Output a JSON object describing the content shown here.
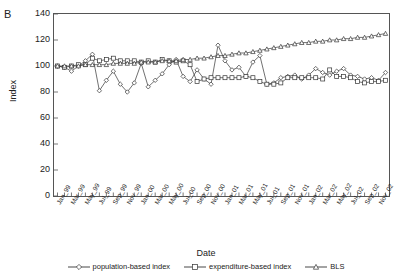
{
  "panel": {
    "label": "B"
  },
  "axes": {
    "ylabel": "Index",
    "xlabel": "Date",
    "yticks": [
      0,
      20,
      40,
      60,
      80,
      100,
      120,
      140
    ],
    "ylim": [
      0,
      140
    ],
    "grid": false
  },
  "legend": {
    "position": "bottom-center",
    "items": [
      {
        "label": "population-based index",
        "marker": "diamond-marker-icon"
      },
      {
        "label": "expenditure-based index",
        "marker": "square-marker-icon"
      },
      {
        "label": "BLS",
        "marker": "triangle-marker-icon"
      }
    ]
  },
  "chart_data": {
    "type": "line",
    "title": "B",
    "xlabel": "Date",
    "ylabel": "Index",
    "ylim": [
      0,
      140
    ],
    "yticks": [
      0,
      20,
      40,
      60,
      80,
      100,
      120,
      140
    ],
    "grid": false,
    "legend_position": "bottom-center",
    "x": [
      "Jan_99",
      "Feb_99",
      "Mar_99",
      "Apr_99",
      "May_99",
      "Jun_99",
      "Jul_99",
      "Aug_99",
      "Sep_99",
      "Oct_99",
      "Nov_99",
      "Dec_99",
      "Jan_00",
      "Feb_00",
      "Mar_00",
      "Apr_00",
      "May_00",
      "Jun_00",
      "Jul_00",
      "Aug_00",
      "Sep_00",
      "Oct_00",
      "Nov_00",
      "Dec_00",
      "Jan_01",
      "Feb_01",
      "Mar_01",
      "Apr_01",
      "May_01",
      "Jun_01",
      "Jul_01",
      "Aug_01",
      "Sep_01",
      "Oct_01",
      "Nov_01",
      "Dec_01",
      "Jan_02",
      "Feb_02",
      "Mar_02",
      "Apr_02",
      "May_02",
      "Jun_02",
      "Jul_02",
      "Aug_02",
      "Sep_02",
      "Oct_02",
      "Nov_02",
      "Dec_02"
    ],
    "xtick_labels": [
      "Jan_99",
      "Mar_99",
      "May_99",
      "Jul_99",
      "Sep_99",
      "Nov_99",
      "Jan_00",
      "Mar_00",
      "May_00",
      "Jul_00",
      "Sep_00",
      "Nov_00",
      "Jan_01",
      "Mar_01",
      "May_01",
      "Jul_01",
      "Sep_01",
      "Nov_01",
      "Jan_02",
      "Mar_02",
      "May_02",
      "Jul_02",
      "Sep_02",
      "Nov_02"
    ],
    "series": [
      {
        "name": "population-based index",
        "marker": "diamond",
        "values": [
          100,
          99,
          96,
          100,
          104,
          109,
          81,
          89,
          96,
          86,
          80,
          87,
          102,
          84,
          89,
          94,
          101,
          105,
          92,
          88,
          97,
          90,
          86,
          116,
          104,
          97,
          99,
          92,
          103,
          108,
          86,
          87,
          91,
          92,
          93,
          90,
          93,
          98,
          95,
          93,
          96,
          98,
          93,
          92,
          90,
          91,
          89,
          95
        ]
      },
      {
        "name": "expenditure-based index",
        "marker": "square",
        "values": [
          100,
          99,
          100,
          101,
          101,
          106,
          104,
          105,
          106,
          104,
          104,
          104,
          103,
          104,
          103,
          105,
          104,
          103,
          104,
          101,
          88,
          90,
          91,
          91,
          91,
          91,
          91,
          92,
          91,
          88,
          86,
          86,
          87,
          91,
          91,
          91,
          91,
          91,
          90,
          97,
          92,
          92,
          91,
          88,
          87,
          88,
          88,
          89
        ]
      },
      {
        "name": "BLS",
        "marker": "triangle",
        "values": [
          100,
          100,
          100,
          100,
          101,
          101,
          101,
          101,
          102,
          102,
          102,
          102,
          103,
          103,
          103,
          104,
          104,
          104,
          105,
          105,
          106,
          106,
          107,
          108,
          108,
          109,
          110,
          110,
          111,
          112,
          113,
          114,
          115,
          116,
          117,
          118,
          118,
          119,
          119,
          120,
          120,
          121,
          121,
          122,
          122,
          123,
          124,
          125
        ]
      }
    ]
  }
}
